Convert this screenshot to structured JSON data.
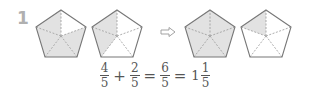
{
  "problem": {
    "number": "1"
  },
  "colors": {
    "shade": "#e2e2e2",
    "stroke": "#777777",
    "dash": "#999999",
    "number": "#b0b0b0"
  },
  "figures": [
    {
      "id": "pent1",
      "shaded_parts": 4,
      "total_parts": 5
    },
    {
      "id": "pent2",
      "shaded_parts": 2,
      "total_parts": 5
    },
    {
      "id": "pent3",
      "shaded_parts": 5,
      "total_parts": 5
    },
    {
      "id": "pent4",
      "shaded_parts": 1,
      "total_parts": 5
    }
  ],
  "arrow": {
    "icon": "right-outline-arrow-icon"
  },
  "equation": {
    "a": {
      "num": "4",
      "den": "5"
    },
    "op1": "+",
    "b": {
      "num": "2",
      "den": "5"
    },
    "eq1": "=",
    "c": {
      "num": "6",
      "den": "5"
    },
    "eq2": "=",
    "mixed": {
      "whole": "1",
      "num": "1",
      "den": "5"
    }
  }
}
